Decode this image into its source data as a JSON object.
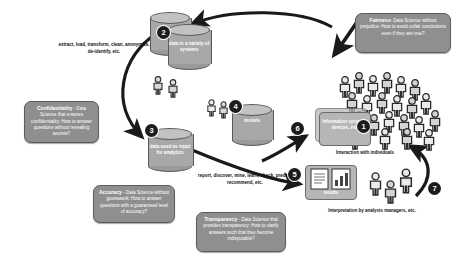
{
  "diagram": {
    "colors": {
      "callout_fill": "#8f8f8f",
      "callout_text": "#ffffff",
      "cylinder_fill": "#a8a8a8",
      "panel_fill": "#b6b6b6",
      "badge_fill": "#1c1c1c",
      "arrow": "#1a1a1a",
      "background": "#ffffff"
    },
    "callouts": [
      {
        "id": "confidentiality",
        "term": "Confidentiality",
        "text": " - Data Science that ensures confidentiality: How to answer questions without revealing secrets?"
      },
      {
        "id": "accuracy",
        "term": "Accuracy",
        "text": " - Data Science without guesswork: How to answer questions with a guaranteed level of accuracy?"
      },
      {
        "id": "transparency",
        "term": "Transparency",
        "text": " - Data Science that provides transparency: How to clarify answers such that they become indisputable?"
      },
      {
        "id": "fairness",
        "term": "Fairness",
        "text": "- Data Science without prejudice: How to avoid unfair conclusions even if they are true?"
      }
    ],
    "nodes": {
      "data_variety": "data in a variety of systems",
      "data_input": "data used as input for analytics",
      "models": "models",
      "info_systems": "Information systems, devices, etc.",
      "results": "results"
    },
    "annotations": {
      "etl": "extract, load, transform, clean, anonymize, de-identify, etc.",
      "analytics": "report, discover, mine, learn, check, predict, recommend, etc.",
      "interaction": "Interaction with individuals",
      "interpretation": "Interpretation by analysts managers, etc."
    },
    "steps": [
      {
        "num": "1",
        "name": "interaction-with-individuals"
      },
      {
        "num": "2",
        "name": "data-in-variety-of-systems"
      },
      {
        "num": "3",
        "name": "data-used-as-input"
      },
      {
        "num": "4",
        "name": "models"
      },
      {
        "num": "5",
        "name": "results"
      },
      {
        "num": "6",
        "name": "back-to-information-systems"
      },
      {
        "num": "7",
        "name": "interpretation-feedback"
      }
    ]
  }
}
